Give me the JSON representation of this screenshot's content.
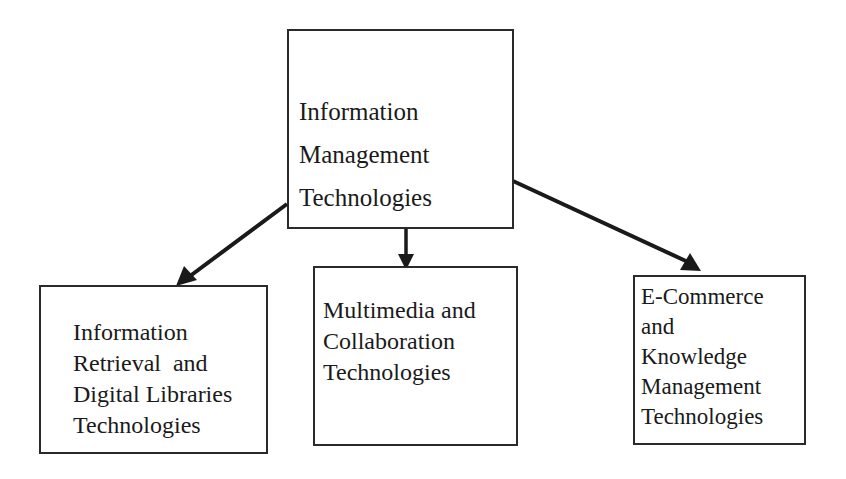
{
  "diagram": {
    "type": "hierarchy",
    "root": {
      "lines": [
        "Information",
        "Management",
        "Technologies"
      ]
    },
    "children": [
      {
        "lines": [
          "Information",
          "Retrieval  and",
          "Digital Libraries",
          "Technologies"
        ]
      },
      {
        "lines": [
          "Multimedia and",
          "Collaboration",
          "Technologies"
        ]
      },
      {
        "lines": [
          "E-Commerce",
          "and",
          "Knowledge",
          "Management",
          "Technologies"
        ]
      }
    ],
    "edges": [
      {
        "from": "root",
        "to": "children.0"
      },
      {
        "from": "root",
        "to": "children.1"
      },
      {
        "from": "root",
        "to": "children.2"
      }
    ],
    "colors": {
      "stroke": "#2a2a2a",
      "text": "#1a1a1a",
      "background": "#ffffff"
    }
  }
}
